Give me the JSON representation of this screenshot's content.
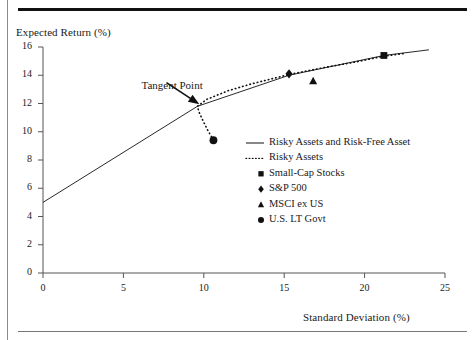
{
  "figure": {
    "ylabel": "Expected Return (%)",
    "xlabel": "Standard Deviation (%)",
    "annotation": "Tangent Point"
  },
  "chart_data": {
    "type": "scatter",
    "title": "",
    "xlabel": "Standard Deviation (%)",
    "ylabel": "Expected Return (%)",
    "xlim": [
      0,
      25
    ],
    "ylim": [
      0,
      16
    ],
    "xticks": [
      "0",
      "5",
      "10",
      "15",
      "20",
      "25"
    ],
    "yticks": [
      "0",
      "2",
      "4",
      "6",
      "8",
      "10",
      "12",
      "14",
      "16"
    ],
    "grid": false,
    "legend_position": "center-right",
    "annotations": [
      {
        "text": "Tangent Point",
        "point_x": 9.6,
        "point_y": 11.8,
        "label_x": 6.0,
        "label_y": 13.2
      }
    ],
    "risk_free_rate": 5.0,
    "tangent_point": {
      "x": 9.6,
      "y": 11.8
    },
    "series": [
      {
        "name": "Risky Assets and Risk-Free Asset",
        "style": "solid-line",
        "x": [
          0.0,
          9.6,
          15.3,
          21.2,
          24.0
        ],
        "y": [
          5.0,
          11.8,
          14.0,
          15.4,
          15.8
        ]
      },
      {
        "name": "Risky Assets",
        "style": "dotted-line",
        "x": [
          10.6,
          10.2,
          9.9,
          9.7,
          9.6,
          10.2,
          11.5,
          13.0,
          15.3,
          17.5,
          19.5,
          21.2,
          22.5
        ],
        "y": [
          9.4,
          10.2,
          10.9,
          11.4,
          11.8,
          12.3,
          12.9,
          13.4,
          14.05,
          14.55,
          14.95,
          15.35,
          15.55
        ]
      }
    ],
    "points": [
      {
        "name": "Small-Cap Stocks",
        "marker": "square",
        "x": 21.2,
        "y": 15.4
      },
      {
        "name": "S&P 500",
        "marker": "diamond",
        "x": 15.3,
        "y": 14.1
      },
      {
        "name": "MSCI ex US",
        "marker": "triangle",
        "x": 16.8,
        "y": 13.6
      },
      {
        "name": "U.S. LT Govt",
        "marker": "circle",
        "x": 10.6,
        "y": 9.4
      }
    ],
    "legend": [
      {
        "label": "Risky Assets and Risk-Free Asset",
        "marker": "solid-line"
      },
      {
        "label": "Risky Assets",
        "marker": "dotted-line"
      },
      {
        "label": "Small-Cap Stocks",
        "marker": "square"
      },
      {
        "label": "S&P 500",
        "marker": "diamond"
      },
      {
        "label": "MSCI ex US",
        "marker": "triangle"
      },
      {
        "label": "U.S. LT Govt",
        "marker": "circle"
      }
    ]
  }
}
